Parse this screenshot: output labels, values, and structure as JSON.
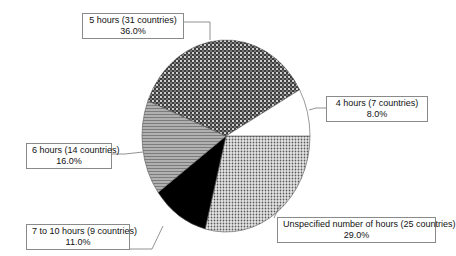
{
  "chart_data": {
    "type": "pie",
    "title": "",
    "start_angle_deg_clockwise_from_top": 90,
    "direction": "clockwise",
    "slices": [
      {
        "label": "Unspecified number of hours (25 countries)",
        "value": 29.0,
        "display": "29.0%",
        "pattern": "light-dots"
      },
      {
        "label": "7 to 10 hours (9 countries)",
        "value": 11.0,
        "display": "11.0%",
        "pattern": "solid-black"
      },
      {
        "label": "6 hours (14 countries)",
        "value": 16.0,
        "display": "16.0%",
        "pattern": "horizontal-stripes"
      },
      {
        "label": "5 hours (31 countries)",
        "value": 36.0,
        "display": "36.0%",
        "pattern": "dark-checker"
      },
      {
        "label": "4 hours (7 countries)",
        "value": 8.0,
        "display": "8.0%",
        "pattern": "white"
      }
    ],
    "legend": "none (callout labels)"
  },
  "labels": {
    "five": {
      "name": "5 hours (31 countries)",
      "pct": "36.0%"
    },
    "four": {
      "name": "4 hours (7 countries)",
      "pct": "8.0%"
    },
    "six": {
      "name": "6 hours (14 countries)",
      "pct": "16.0%"
    },
    "seven_ten": {
      "name": "7 to 10 hours (9 countries)",
      "pct": "11.0%"
    },
    "unspecified": {
      "name": "Unspecified number of hours (25 countries)",
      "pct": "29.0%"
    }
  }
}
